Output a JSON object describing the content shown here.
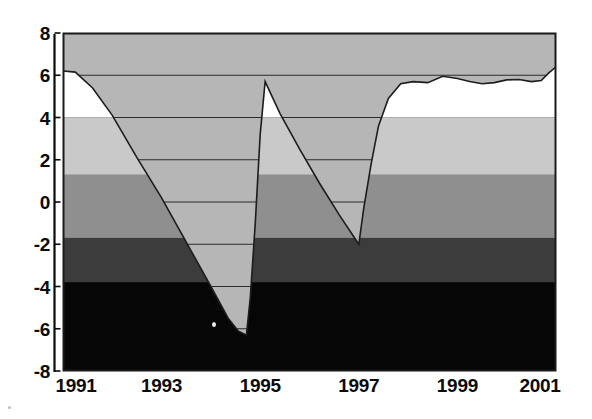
{
  "figure": {
    "width": 592,
    "height": 419,
    "background": "#ffffff"
  },
  "plot_area": {
    "left": 63,
    "right": 556,
    "top": 33,
    "bottom": 371,
    "frame_color": "#1a1a1a"
  },
  "colors": {
    "band_white": "#ffffff",
    "band_light_gray": "#c9c9c9",
    "band_medium_gray": "#8f8f8f",
    "band_dark_gray": "#3c3c3c",
    "band_black": "#060606",
    "wedge_fill": "#b6b6b6",
    "line_color": "#1d1d1d",
    "gridline_color": "#2b2b2b",
    "text_color": "#0b0b0b"
  },
  "axes": {
    "y_ticks": [
      "8",
      "6",
      "4",
      "2",
      "0",
      "-2",
      "-4",
      "-6",
      "-8"
    ],
    "y_tick_values": [
      8,
      6,
      4,
      2,
      0,
      -2,
      -4,
      -6,
      -8
    ],
    "x_ticks": [
      "1991",
      "1993",
      "1995",
      "1997",
      "1999",
      "2001"
    ],
    "x_tick_values": [
      1991,
      1993,
      1995,
      1997,
      1999,
      2001
    ]
  },
  "chart_data": {
    "type": "area",
    "title": "",
    "subtitle": "",
    "xlabel": "",
    "ylabel": "",
    "xlim": [
      1991,
      2001
    ],
    "ylim": [
      -8,
      8
    ],
    "grid": true,
    "gridlines_y": [
      6,
      4,
      2,
      0,
      -2,
      -4,
      -6
    ],
    "legend": "none",
    "legend_position": "none",
    "series": [
      {
        "name": "series-1",
        "fill": "above-line",
        "x": [
          1991.0,
          1991.25,
          1991.6,
          1992.0,
          1992.5,
          1993.0,
          1993.5,
          1994.0,
          1994.35,
          1994.55,
          1994.72,
          1994.8,
          1994.9,
          1995.0,
          1995.1,
          1995.4,
          1995.8,
          1996.2,
          1996.6,
          1997.0,
          1997.1,
          1997.25,
          1997.4,
          1997.6,
          1997.85,
          1998.1,
          1998.4,
          1998.7,
          1999.0,
          1999.25,
          1999.5,
          1999.75,
          2000.0,
          2000.25,
          2000.5,
          2000.7,
          2000.85,
          2001.0
        ],
        "values": [
          6.2,
          6.15,
          5.4,
          4.1,
          2.1,
          0.2,
          -1.9,
          -4.0,
          -5.5,
          -6.1,
          -6.3,
          -4.5,
          -1.0,
          3.2,
          5.7,
          4.2,
          2.5,
          0.9,
          -0.6,
          -2.0,
          -0.3,
          1.8,
          3.6,
          4.9,
          5.6,
          5.7,
          5.65,
          5.95,
          5.85,
          5.7,
          5.6,
          5.65,
          5.78,
          5.8,
          5.7,
          5.75,
          6.1,
          6.4
        ]
      }
    ],
    "background_bands": [
      {
        "name": "band-top-white",
        "from": 4.0,
        "to": 8.0,
        "color": "#ffffff"
      },
      {
        "name": "band-light-gray",
        "from": 1.3,
        "to": 4.0,
        "color": "#c9c9c9"
      },
      {
        "name": "band-medium-gray",
        "from": -1.7,
        "to": 1.3,
        "color": "#8f8f8f"
      },
      {
        "name": "band-dark-gray",
        "from": -3.8,
        "to": -1.7,
        "color": "#3c3c3c"
      },
      {
        "name": "band-black",
        "from": -8.0,
        "to": -3.8,
        "color": "#060606"
      }
    ]
  }
}
